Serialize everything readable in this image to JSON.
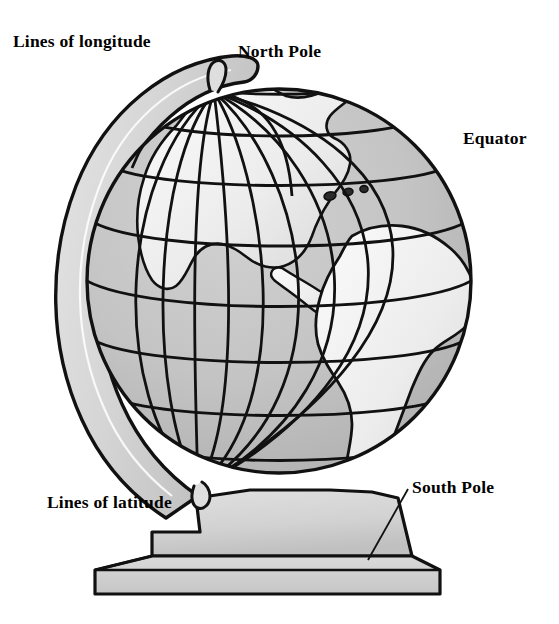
{
  "figure": {
    "labels": [
      {
        "id": "lines-of-longitude",
        "text": "Lines of longitude"
      },
      {
        "id": "north-pole",
        "text": "North Pole"
      },
      {
        "id": "equator",
        "text": "Equator"
      },
      {
        "id": "lines-of-latitude",
        "text": "Lines of latitude"
      },
      {
        "id": "south-pole",
        "text": "South Pole"
      }
    ],
    "colors": {
      "background": "#ffffff",
      "ink": "#111111",
      "ocean": "#c3c3c3",
      "ocean_shadow": "#aeaeae",
      "land": "#f2f2f2",
      "land_shade": "#d9d9d9",
      "ring": "#d7d7d7",
      "ring_shade": "#bdbdbd",
      "base": "#d2d2d2",
      "base_top": "#dcdcdc",
      "base_shadow": "#bcbcbc"
    },
    "globe": {
      "center_x": 279,
      "center_y": 281,
      "radius": 192,
      "latitude_line_count": 9,
      "longitude_line_count": 11,
      "continents": [
        "North America",
        "South America",
        "Caribbean islands"
      ]
    },
    "stand": {
      "meridian_ring": true,
      "pedestal": true,
      "plinth": true
    }
  }
}
